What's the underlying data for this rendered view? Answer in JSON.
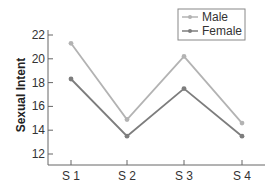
{
  "chart_data": {
    "type": "line",
    "title": "",
    "xlabel": "",
    "ylabel": "Sexual Intent",
    "categories": [
      "S 1",
      "S 2",
      "S 3",
      "S 4"
    ],
    "series": [
      {
        "name": "Male",
        "values": [
          21.3,
          14.9,
          20.2,
          14.6
        ],
        "color": "#b3b3b3"
      },
      {
        "name": "Female",
        "values": [
          18.3,
          13.5,
          17.5,
          13.5
        ],
        "color": "#7d7d7d"
      }
    ],
    "yticks": [
      12,
      14,
      16,
      18,
      20,
      22
    ],
    "ylim": [
      11,
      22
    ],
    "grid": false,
    "legend_position": "top-right"
  },
  "legend": {
    "items": [
      {
        "label": "Male"
      },
      {
        "label": "Female"
      }
    ]
  },
  "axis": {
    "ylabel": "Sexual Intent"
  }
}
